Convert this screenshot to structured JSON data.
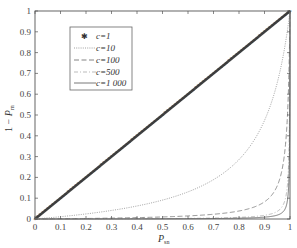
{
  "chart_data": {
    "type": "line",
    "title": "",
    "xlabel": "P_sn",
    "ylabel": "1 − P_rn",
    "xlim": [
      0,
      1
    ],
    "ylim": [
      0,
      1
    ],
    "grid": false,
    "legend_position": "upper-left",
    "x_ticks": [
      "0",
      "0.1",
      "0.2",
      "0.3",
      "0.4",
      "0.5",
      "0.6",
      "0.7",
      "0.8",
      "0.9",
      "1"
    ],
    "y_ticks": [
      "0",
      "0.1",
      "0.2",
      "0.3",
      "0.4",
      "0.5",
      "0.6",
      "0.7",
      "0.8",
      "0.9",
      "1"
    ],
    "x": [
      0,
      0.1,
      0.2,
      0.3,
      0.4,
      0.5,
      0.6,
      0.7,
      0.8,
      0.9,
      0.95,
      0.99,
      1
    ],
    "series": [
      {
        "name": "c=1",
        "label": "c=1",
        "style": "star-markers",
        "values": [
          0,
          0.1,
          0.2,
          0.3,
          0.4,
          0.5,
          0.6,
          0.7,
          0.8,
          0.9,
          0.95,
          0.99,
          1
        ]
      },
      {
        "name": "c=10",
        "label": "c=10",
        "style": "dotted",
        "values": [
          0,
          0.011,
          0.024,
          0.041,
          0.063,
          0.091,
          0.13,
          0.189,
          0.286,
          0.474,
          0.655,
          0.908,
          1
        ]
      },
      {
        "name": "c=100",
        "label": "c=100",
        "style": "dashed",
        "values": [
          0,
          0.001,
          0.0025,
          0.004,
          0.007,
          0.01,
          0.015,
          0.023,
          0.038,
          0.083,
          0.16,
          0.497,
          1
        ]
      },
      {
        "name": "c=500",
        "label": "c=500",
        "style": "dash-dot",
        "values": [
          0,
          0.0002,
          0.0005,
          0.0009,
          0.0013,
          0.002,
          0.003,
          0.0047,
          0.008,
          0.018,
          0.037,
          0.165,
          1
        ]
      },
      {
        "name": "c=1000",
        "label": "c=1 000",
        "style": "solid",
        "values": [
          0,
          0.0001,
          0.00025,
          0.0004,
          0.0007,
          0.001,
          0.0015,
          0.0023,
          0.004,
          0.009,
          0.019,
          0.09,
          1
        ]
      }
    ]
  },
  "axes": {
    "xlabel_main": "P",
    "xlabel_sub": "sn",
    "ylabel_prefix": "1 − ",
    "ylabel_main": "P",
    "ylabel_sub": "rn"
  },
  "legend": {
    "items": [
      {
        "label": "c=1"
      },
      {
        "label": "c=10"
      },
      {
        "label": "c=100"
      },
      {
        "label": "c=500"
      },
      {
        "label": "c=1 000"
      }
    ]
  },
  "colors": {
    "axis": "#555555",
    "c1": "#444444",
    "c10": "#888888",
    "c100": "#777777",
    "c500": "#aaaaaa",
    "c1000": "#555555"
  }
}
